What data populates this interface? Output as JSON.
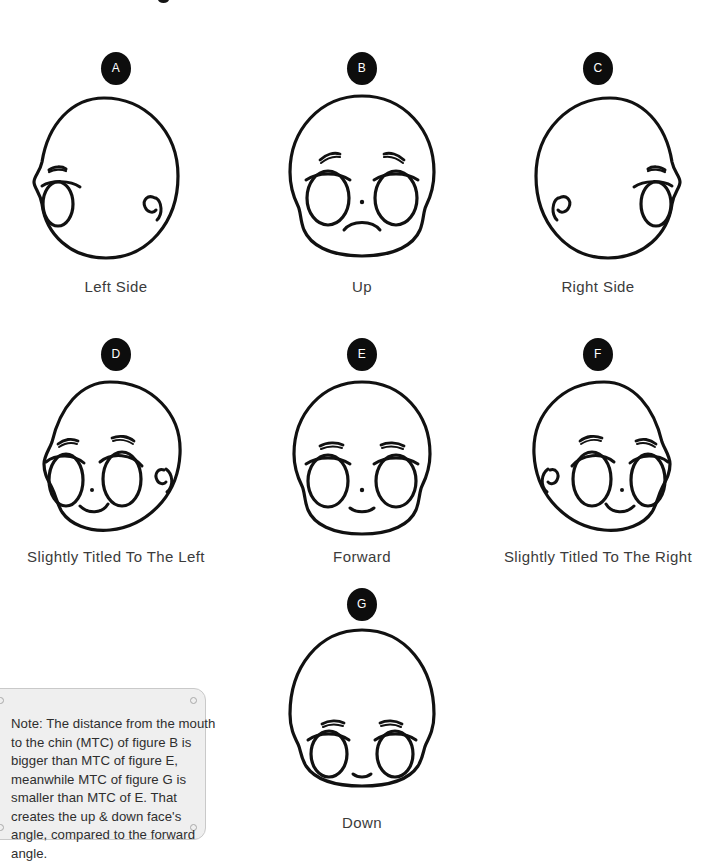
{
  "sheet": {
    "background_color": "#ffffff",
    "badge_color": "#0d0d0d",
    "badge_text_color": "#ffffff",
    "ink_color": "#111111",
    "caption_highlight_color": "#c8c8c8",
    "note_background_color": "#efefef",
    "note_border_color": "#c9c9c9"
  },
  "figures": [
    {
      "badge": "A",
      "caption": "Left Side",
      "pose": "profile-left",
      "description": "Head in left-side profile: single eye at far left, ear curl at right"
    },
    {
      "badge": "B",
      "caption": "Up",
      "pose": "looking-up",
      "description": "Head tilted up: eyes high on face, frowning mouth low, long chin"
    },
    {
      "badge": "C",
      "caption": "Right Side",
      "pose": "profile-right",
      "description": "Head in right-side profile: single eye at far right, ear curl at left"
    },
    {
      "badge": "D",
      "caption": "Slightly Titled To The Left",
      "pose": "three-quarter-left",
      "description": "Head turned slightly left: features shifted left, ear curl on right"
    },
    {
      "badge": "E",
      "caption": "Forward",
      "pose": "forward",
      "description": "Head facing forward: symmetric eyes, nose dot, small smile"
    },
    {
      "badge": "F",
      "caption": "Slightly Titled To The Right",
      "pose": "three-quarter-right",
      "description": "Head turned slightly right: features shifted right, ear curl on left"
    },
    {
      "badge": "G",
      "caption": "Down",
      "pose": "looking-down",
      "description": "Head tilted down: eyes low on face, mouth close to chin"
    }
  ],
  "note": {
    "text": "Note: The distance from the mouth to the chin (MTC) of figure B is bigger than MTC of figure E, meanwhile MTC of figure G is smaller than MTC of E. That creates the up & down face's angle, compared to the forward angle."
  }
}
